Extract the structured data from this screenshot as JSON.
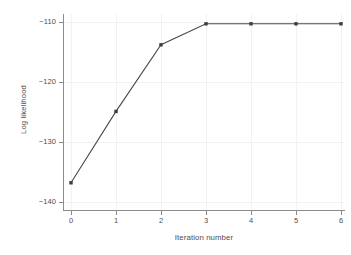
{
  "chart_data": {
    "type": "line",
    "title": "",
    "xlabel": "Iteration number",
    "ylabel": "Log likelihood",
    "x": [
      0,
      1,
      2,
      3,
      4,
      5,
      6
    ],
    "values": [
      -136.8,
      -124.9,
      -113.8,
      -110.3,
      -110.3,
      -110.3,
      -110.3
    ],
    "series": [
      {
        "name": "Log likelihood",
        "values": [
          -136.8,
          -124.9,
          -113.8,
          -110.3,
          -110.3,
          -110.3,
          -110.3
        ]
      }
    ],
    "xlim": [
      -0.18,
      6.25
    ],
    "ylim": [
      -141.3,
      -108.7
    ],
    "xticks": [
      0,
      1,
      2,
      3,
      4,
      5,
      6
    ],
    "yticks": [
      -110,
      -120,
      -130,
      -140
    ],
    "xticklabels": [
      "0",
      "1",
      "2",
      "3",
      "4",
      "5",
      "6"
    ],
    "yticklabels": [
      "−110",
      "−120",
      "−130",
      "−140"
    ],
    "grid": true,
    "grid_color": "#f2f2f2",
    "legend": null,
    "legend_position": "none",
    "marker": "square",
    "line_color": "#4a4a4a",
    "marker_color": "#3d3d3d",
    "axis_color": "#8c8c8c",
    "background": "#ffffff",
    "annotations": []
  },
  "labels": {
    "x_axis_title": "Iteration number",
    "y_axis_title": "Log likelihood",
    "y_tick_0": "−110",
    "y_tick_1": "−120",
    "y_tick_2": "−130",
    "y_tick_3": "−140",
    "x_tick_0": "0",
    "x_tick_1": "1",
    "x_tick_2": "2",
    "x_tick_3": "3",
    "x_tick_4": "4",
    "x_tick_5": "5",
    "x_tick_6": "6"
  }
}
